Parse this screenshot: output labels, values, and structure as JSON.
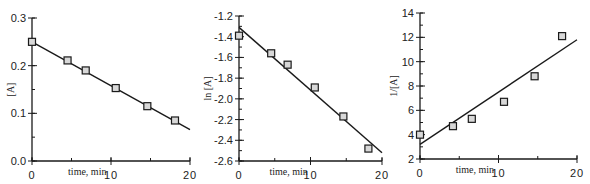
{
  "chart_data": [
    {
      "type": "scatter",
      "title": "",
      "xlabel": "time, min",
      "ylabel": "[A]",
      "xlim": [
        0,
        20
      ],
      "ylim": [
        0.0,
        0.3
      ],
      "xticks": [
        0,
        10,
        20
      ],
      "xtick_labels": [
        "0",
        "10",
        "20"
      ],
      "yticks": [
        0.0,
        0.1,
        0.2,
        0.3
      ],
      "ytick_labels": [
        "0.0",
        "0.1",
        "0.2",
        "0.3"
      ],
      "y_minor_step": 0.05,
      "x_minor_step": 5,
      "grid": false,
      "series": [
        {
          "name": "data",
          "marker": "square",
          "x": [
            0,
            4.5,
            6.8,
            10.6,
            14.6,
            18.1
          ],
          "y": [
            0.25,
            0.211,
            0.19,
            0.153,
            0.115,
            0.085
          ]
        }
      ],
      "fit_line": {
        "x": [
          0,
          20
        ],
        "y": [
          0.25,
          0.066
        ]
      }
    },
    {
      "type": "scatter",
      "title": "",
      "xlabel": "time, min",
      "ylabel": "ln [A]",
      "xlim": [
        0,
        20
      ],
      "ylim": [
        -2.6,
        -1.2
      ],
      "xticks": [
        0,
        10,
        20
      ],
      "xtick_labels": [
        "0",
        "10",
        "20"
      ],
      "yticks": [
        -2.6,
        -2.4,
        -2.2,
        -2.0,
        -1.8,
        -1.6,
        -1.4,
        -1.2
      ],
      "ytick_labels": [
        "-2.6",
        "-2.4",
        "-2.2",
        "-2.0",
        "-1.8",
        "-1.6",
        "-1.4",
        "-1.2"
      ],
      "y_minor_step": 0.1,
      "x_minor_step": 5,
      "grid": false,
      "series": [
        {
          "name": "data",
          "marker": "square",
          "x": [
            0,
            4.5,
            6.8,
            10.6,
            14.6,
            18.1
          ],
          "y": [
            -1.39,
            -1.56,
            -1.67,
            -1.89,
            -2.17,
            -2.48
          ]
        }
      ],
      "fit_line": {
        "x": [
          0,
          20
        ],
        "y": [
          -1.31,
          -2.52
        ]
      }
    },
    {
      "type": "scatter",
      "title": "",
      "xlabel": "time, min",
      "ylabel": "1/[A]",
      "xlim": [
        0,
        20
      ],
      "ylim": [
        2,
        14
      ],
      "xticks": [
        0,
        10,
        20
      ],
      "xtick_labels": [
        "0",
        "10",
        "20"
      ],
      "yticks": [
        2,
        4,
        6,
        8,
        10,
        12,
        14
      ],
      "ytick_labels": [
        "2",
        "4",
        "6",
        "8",
        "10",
        "12",
        "14"
      ],
      "y_minor_step": 1,
      "x_minor_step": 5,
      "grid": false,
      "series": [
        {
          "name": "data",
          "marker": "square",
          "x": [
            0,
            4.2,
            6.6,
            10.7,
            14.6,
            18.1
          ],
          "y": [
            4.0,
            4.7,
            5.3,
            6.7,
            8.8,
            12.1
          ]
        }
      ],
      "fit_line": {
        "x": [
          0,
          20
        ],
        "y": [
          3.2,
          11.8
        ]
      }
    }
  ]
}
